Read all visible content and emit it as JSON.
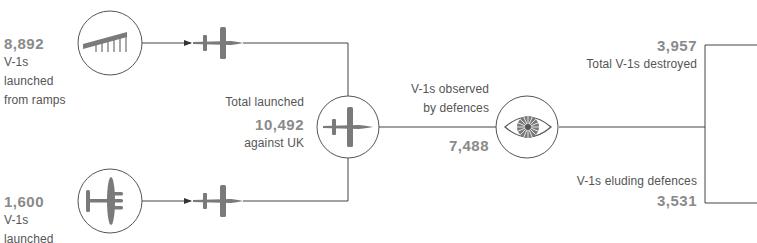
{
  "colors": {
    "line": "#444444",
    "icon": "#7a7a7a",
    "number": "#8a8a8a",
    "text": "#555555",
    "circle": "#555555"
  },
  "sources": [
    {
      "value": "8,892",
      "line1": "V-1s",
      "line2": "launched",
      "line3": "from ramps",
      "icon": "launch-ramp-icon"
    },
    {
      "value": "1,600",
      "line1": "V-1s",
      "line2": "launched",
      "icon": "bomber-aircraft-icon"
    }
  ],
  "total": {
    "label_top": "Total launched",
    "value": "10,492",
    "label_bottom": "against UK",
    "icon": "v1-flying-bomb-icon"
  },
  "observed": {
    "label_line1": "V-1s observed",
    "label_line2": "by defences",
    "value": "7,488",
    "icon": "eye-icon"
  },
  "destroyed": {
    "value": "3,957",
    "label": "Total V-1s destroyed"
  },
  "eluding": {
    "label": "V-1s eluding defences",
    "value": "3,531"
  }
}
